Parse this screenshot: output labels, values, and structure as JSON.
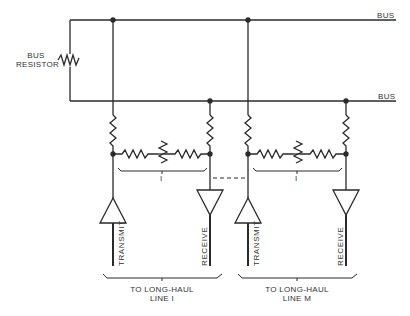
{
  "diagram": {
    "type": "circuit-schematic",
    "colors": {
      "line": "#2a2a2a",
      "text": "#333333",
      "background": "#ffffff"
    },
    "labels": {
      "bus_top": "BUS",
      "bus_bottom": "BUS",
      "bus_resistor_line1": "BUS",
      "bus_resistor_line2": "RESISTOR",
      "group_i_mark": "I",
      "group_m_mark": "I",
      "transmit_i": "TRANSMIT",
      "receive_i": "RECEIVE",
      "transmit_m": "TRANSMIT",
      "receive_m": "RECEIVE",
      "line_i_1": "TO LONG-HAUL",
      "line_i_2": "LINE I",
      "line_m_1": "TO LONG-HAUL",
      "line_m_2": "LINE M"
    },
    "components": [
      {
        "kind": "bus",
        "name": "top bus"
      },
      {
        "kind": "bus",
        "name": "bottom bus"
      },
      {
        "kind": "resistor",
        "name": "bus resistor"
      },
      {
        "kind": "interface",
        "name": "line I interface",
        "parts": [
          "2 pull resistors",
          "2 series resistors",
          "potentiometer",
          "transmit amplifier",
          "receive amplifier"
        ]
      },
      {
        "kind": "interface",
        "name": "line M interface",
        "parts": [
          "2 pull resistors",
          "2 series resistors",
          "potentiometer",
          "transmit amplifier",
          "receive amplifier"
        ]
      }
    ]
  }
}
